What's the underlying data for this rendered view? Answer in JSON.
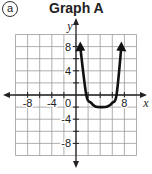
{
  "label": "a",
  "title": "Graph A",
  "chart_data": {
    "type": "line",
    "title": "Graph A",
    "xlabel": "x",
    "ylabel": "y",
    "xlim": [
      -10,
      10
    ],
    "ylim": [
      -10,
      10
    ],
    "grid": true,
    "grid_step": 2,
    "x_ticks": [
      -8,
      -4,
      0,
      8
    ],
    "x_tick_labels": [
      "-8",
      "-4",
      "0",
      "8"
    ],
    "y_ticks": [
      8,
      4,
      -4,
      -8
    ],
    "y_tick_labels": [
      "8",
      "4",
      "-4",
      "-8"
    ],
    "series": [
      {
        "name": "curve",
        "note": "Approximate points read visually from the screenshot; not labeled values, and not fit to a formula (the drawn curve does not match a single clean parabola).",
        "x": [
          0.7,
          1.7,
          2.5,
          3.2,
          4.2,
          5.2,
          6.0,
          6.7,
          7.5
        ],
        "y": [
          8,
          0,
          -1.3,
          -1.9,
          -2,
          -1.9,
          -1.3,
          0,
          8
        ],
        "end_arrows": true
      }
    ]
  }
}
